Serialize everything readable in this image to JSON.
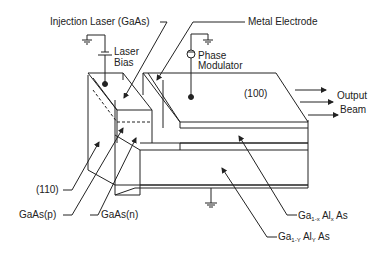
{
  "diagram": {
    "labels": {
      "injection_laser": "Injection Laser (GaAs)",
      "metal_electrode": "Metal Electrode",
      "laser_bias_1": "Laser",
      "laser_bias_2": "Bias",
      "phase_1": "Phase",
      "phase_2": "Modulator",
      "face_100": "(100)",
      "output_1": "Output",
      "output_2": "Beam",
      "face_110": "(110)",
      "gaas_p": "GaAs(p)",
      "gaas_n": "GaAs(n)",
      "gaalx_ga": "Ga",
      "gaalx_sub1": "1-x",
      "gaalx_al": " Al",
      "gaalx_sub2": "x",
      "gaalx_as": " As",
      "gaaly_ga": "Ga",
      "gaaly_sub1": "1-Y",
      "gaaly_al": " Al",
      "gaaly_sub2": "Y",
      "gaaly_as": " As"
    },
    "line_color": "#222222"
  }
}
